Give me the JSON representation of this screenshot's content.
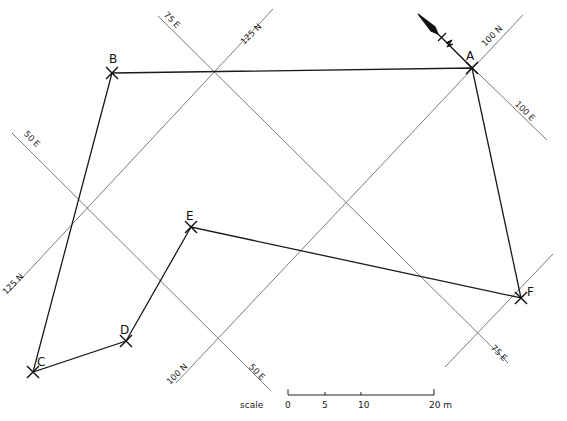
{
  "diagram": {
    "colors": {
      "grid": "#7a7a7a",
      "traverse": "#1a1a1a",
      "background": "#ffffff"
    }
  },
  "grid_lines": [
    {
      "id": "75E",
      "label": "75 E",
      "x1": 158,
      "y1": 16,
      "x2": 508,
      "y2": 363,
      "labels": [
        {
          "text": "75 E",
          "x": 170,
          "y": 22,
          "angle": 45
        },
        {
          "text": "75 E",
          "x": 497,
          "y": 355,
          "angle": 45
        }
      ]
    },
    {
      "id": "125N",
      "label": "125 N",
      "x1": 273,
      "y1": 9,
      "x2": 9,
      "y2": 292,
      "labels": [
        {
          "text": "125 N",
          "x": 253,
          "y": 36,
          "angle": -45
        },
        {
          "text": "125 N",
          "x": 15,
          "y": 286,
          "angle": -45
        }
      ]
    },
    {
      "id": "50E",
      "label": "50 E",
      "x1": 12,
      "y1": 133,
      "x2": 270,
      "y2": 390,
      "labels": [
        {
          "text": "50 E",
          "x": 30,
          "y": 141,
          "angle": 45
        },
        {
          "text": "50 E",
          "x": 255,
          "y": 374,
          "angle": 45
        }
      ]
    },
    {
      "id": "100N",
      "label": "100 N",
      "x1": 523,
      "y1": 15,
      "x2": 176,
      "y2": 383,
      "labels": [
        {
          "text": "100 N",
          "x": 494,
          "y": 38,
          "angle": -45
        },
        {
          "text": "100 N",
          "x": 179,
          "y": 376,
          "angle": -45
        }
      ]
    },
    {
      "id": "100E",
      "label": "100 E",
      "x1": 446,
      "y1": 42,
      "x2": 547,
      "y2": 140,
      "labels": [
        {
          "text": "100 E",
          "x": 523,
          "y": 113,
          "angle": 45
        }
      ]
    },
    {
      "id": "unlabeled-N",
      "label": "",
      "x1": 553,
      "y1": 254,
      "x2": 445,
      "y2": 367,
      "labels": []
    }
  ],
  "stations": [
    {
      "name": "A",
      "x": 472,
      "y": 68,
      "label_x": 466,
      "label_y": 60
    },
    {
      "name": "B",
      "x": 112,
      "y": 73,
      "label_x": 109,
      "label_y": 63
    },
    {
      "name": "C",
      "x": 33,
      "y": 372,
      "label_x": 37,
      "label_y": 366
    },
    {
      "name": "D",
      "x": 126,
      "y": 341,
      "label_x": 120,
      "label_y": 334
    },
    {
      "name": "E",
      "x": 191,
      "y": 227,
      "label_x": 186,
      "label_y": 220
    },
    {
      "name": "F",
      "x": 521,
      "y": 298,
      "label_x": 527,
      "label_y": 296
    }
  ],
  "traverse": [
    "B",
    "A",
    "F",
    "E",
    "D",
    "C",
    "B"
  ],
  "north_arrow": {
    "tail_x": 418,
    "tail_y": 14,
    "tip_x": 438,
    "tip_y": 34,
    "line_end_x": 472,
    "line_end_y": 68
  },
  "scale_bar": {
    "label": "scale",
    "label_x": 240,
    "label_y": 408,
    "x_start": 288,
    "x_end": 434,
    "y": 395,
    "ticks": [
      {
        "text": "0",
        "x": 288
      },
      {
        "text": "5",
        "x": 325
      },
      {
        "text": "10",
        "x": 361
      },
      {
        "text": "20 m",
        "x": 434
      }
    ]
  }
}
